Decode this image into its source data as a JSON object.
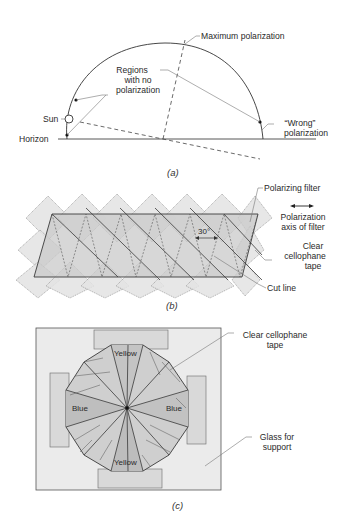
{
  "figure": {
    "panel_a": {
      "caption": "(a)",
      "labels": {
        "maximum_polarization": "Maximum polarization",
        "regions_line1": "Regions",
        "regions_line2": "with no",
        "regions_line3": "polarization",
        "sun": "Sun",
        "horizon": "Horizon",
        "wrong_line1": "“Wrong”",
        "wrong_line2": "polarization"
      }
    },
    "panel_b": {
      "caption": "(b)",
      "angle_label": "30°",
      "labels": {
        "polarizing_filter": "Polarizing filter",
        "axis_arrow": "←→",
        "axis_line1": "Polarization",
        "axis_line2": "axis of filter",
        "tape_line1": "Clear",
        "tape_line2": "cellophane",
        "tape_line3": "tape",
        "cut_line": "Cut line"
      }
    },
    "panel_c": {
      "caption": "(c)",
      "color_labels": {
        "top": "Yellow",
        "bottom": "Yellow",
        "left": "Blue",
        "right": "Blue"
      },
      "labels": {
        "tape_line1": "Clear cellophane",
        "tape_line2": "tape",
        "glass_line1": "Glass for",
        "glass_line2": "support"
      }
    },
    "colors": {
      "line": "#3a3a3a",
      "tape_fill": "#e6e6e6",
      "filter_fill": "#cfcfcf",
      "glass_fill": "#ececec"
    }
  }
}
